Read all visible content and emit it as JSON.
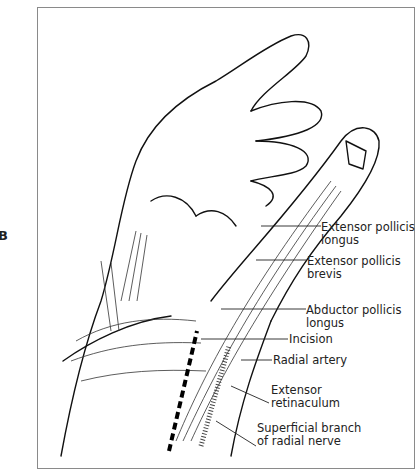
{
  "figure": {
    "panel_letter": "B",
    "labels": [
      {
        "id": "epl",
        "line1": "Extensor pollicis",
        "line2": "longus"
      },
      {
        "id": "epb",
        "line1": "Extensor pollicis",
        "line2": "brevis"
      },
      {
        "id": "apl",
        "line1": "Abductor pollicis",
        "line2": "longus"
      },
      {
        "id": "incision",
        "line1": "Incision",
        "line2": ""
      },
      {
        "id": "radial-artery",
        "line1": "Radial artery",
        "line2": ""
      },
      {
        "id": "retinaculum",
        "line1": "Extensor",
        "line2": "retinaculum"
      },
      {
        "id": "srn",
        "line1": "Superficial branch",
        "line2": "of radial nerve"
      }
    ]
  }
}
